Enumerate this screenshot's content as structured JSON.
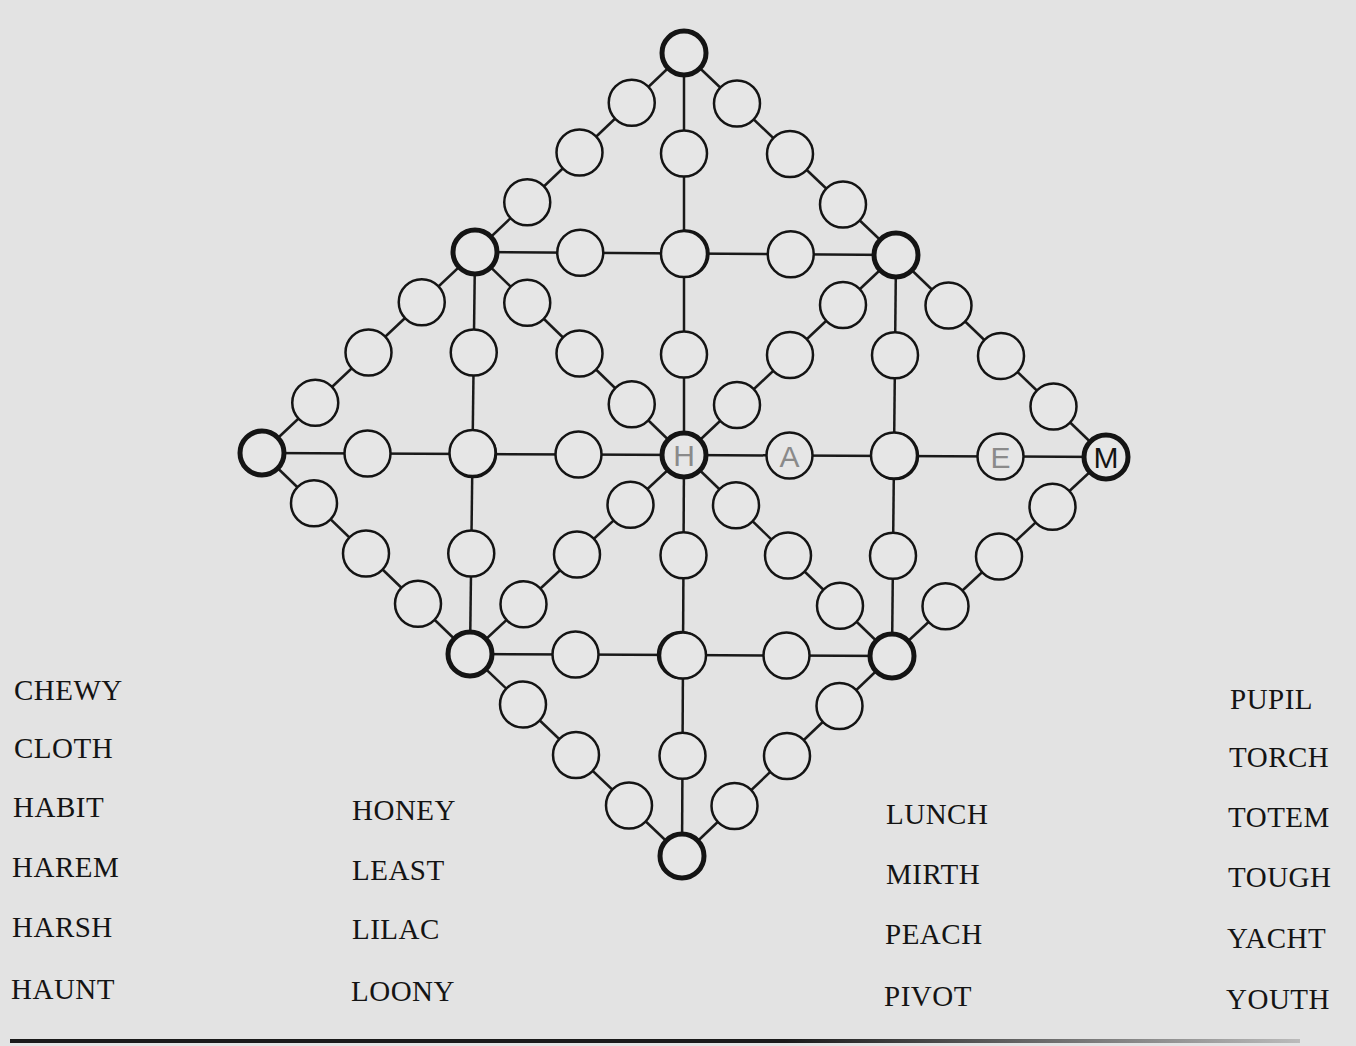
{
  "puzzle": {
    "type": "word-path-grid",
    "given_letter": {
      "node": "right",
      "letter": "M"
    },
    "pencil_letters": [
      {
        "node": "center",
        "letter": "H"
      },
      {
        "node": "r1",
        "letter": "A"
      },
      {
        "node": "rc",
        "letter": "R"
      },
      {
        "node": "r3",
        "letter": "E"
      }
    ],
    "colors": {
      "background": "#e3e3e3",
      "ink": "#141414",
      "pencil": "#8a8a8a",
      "node_fill": "#e6e6e6"
    }
  },
  "word_list": {
    "col1": [
      "CHEWY",
      "CLOTH",
      "HABIT",
      "HAREM",
      "HARSH",
      "HAUNT"
    ],
    "col2": [
      "HONEY",
      "LEAST",
      "LILAC",
      "LOONY"
    ],
    "col3": [
      "LUNCH",
      "MIRTH",
      "PEACH",
      "PIVOT"
    ],
    "col4": [
      "PUPIL",
      "TORCH",
      "TOTEM",
      "TOUGH",
      "YACHT",
      "YOUTH"
    ]
  }
}
